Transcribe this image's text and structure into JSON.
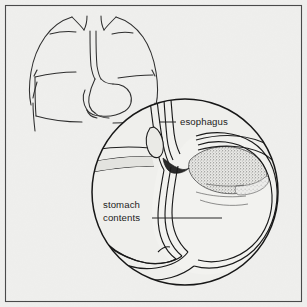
{
  "figure": {
    "background_color": "#efefed",
    "ink_color": "#1a1a1a",
    "frame": {
      "name": "illustration-border",
      "stroke_color": "#3a3a3a",
      "x": 5,
      "y": 5,
      "width": 297,
      "height": 297
    }
  },
  "torso": {
    "name": "human-torso-outline",
    "description": "Line drawing of upper body showing shoulders, neck and arms with internal stomach outline",
    "stroke_color": "#2b2b2b"
  },
  "magnifier": {
    "name": "magnified-circle",
    "description": "Circular magnified cutaway of the stomach and lower esophagus",
    "center_x": 185,
    "center_y": 192,
    "radius": 94,
    "stroke_color": "#1a1a1a"
  },
  "contents_fill": {
    "name": "stomach-contents-stipple",
    "description": "Stippled texture representing stomach contents refluxing into the esophagus",
    "color": "#6f6f6f"
  },
  "labels": [
    {
      "id": "esophagus",
      "name": "label-esophagus",
      "text": "esophagus",
      "lines": [
        "esophagus"
      ],
      "text_x": 180,
      "text_y": 125,
      "anchor": "start",
      "leader": {
        "x1": 159,
        "y1": 122,
        "x2": 176,
        "y2": 122
      }
    },
    {
      "id": "stomach-contents",
      "name": "label-stomach-contents",
      "text": "stomach contents",
      "lines": [
        "stomach",
        "contents"
      ],
      "text_x": 103,
      "text_y": 208,
      "anchor": "start",
      "leader": {
        "x1": 152,
        "y1": 218,
        "x2": 222,
        "y2": 218
      }
    }
  ]
}
